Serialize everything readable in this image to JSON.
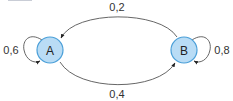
{
  "diagram": {
    "type": "markov-chain",
    "colors": {
      "node_fill": "#b9dcf5",
      "node_stroke": "#4a9fd8",
      "edge": "#444444",
      "text": "#333333"
    },
    "nodes": [
      {
        "id": "A",
        "label": "A"
      },
      {
        "id": "B",
        "label": "B"
      }
    ],
    "edges": [
      {
        "from": "A",
        "to": "A",
        "label": "0,6"
      },
      {
        "from": "B",
        "to": "A",
        "label": "0,2"
      },
      {
        "from": "A",
        "to": "B",
        "label": "0,4"
      },
      {
        "from": "B",
        "to": "B",
        "label": "0,8"
      }
    ]
  }
}
